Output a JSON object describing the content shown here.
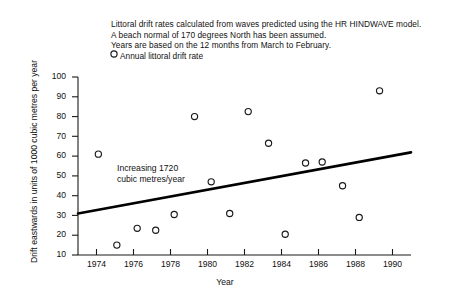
{
  "header": {
    "line1": "Littoral drift rates calculated from waves predicted using the HR HINDWAVE model.",
    "line2": "A beach normal of 170 degrees North has been assumed.",
    "line3": "Years are based on the 12 months from March to February."
  },
  "legend": {
    "marker_icon": "open-circle-icon",
    "label": "Annual littoral drift rate"
  },
  "annotation": {
    "line1": "Increasing 1720",
    "line2": "cubic metres/year"
  },
  "chart_data": {
    "type": "scatter",
    "title": "Littoral drift rates calculated from waves predicted using the HR HINDWAVE model. A beach normal of 170 degrees North has been assumed. Years are based on the 12 months from March to February.",
    "xlabel": "Year",
    "ylabel": "Drift eastwards in units of 1000 cubic metres per year",
    "xlim": [
      1973,
      1991
    ],
    "ylim": [
      10,
      100
    ],
    "xticks": [
      1974,
      1976,
      1978,
      1980,
      1982,
      1984,
      1986,
      1988,
      1990
    ],
    "xtick_labels": [
      "1974",
      "1976",
      "1978",
      "1980",
      "1982",
      "1984",
      "1986",
      "1988",
      "1990"
    ],
    "yticks": [
      10,
      20,
      30,
      40,
      50,
      60,
      70,
      80,
      90,
      100
    ],
    "ytick_labels": [
      "10",
      "20",
      "30",
      "40",
      "50",
      "60",
      "70",
      "80",
      "90",
      "100"
    ],
    "grid": false,
    "legend_position": "top-left",
    "marker": "open-circle",
    "series": [
      {
        "name": "Annual littoral drift rate",
        "x": [
          1974.1,
          1975.1,
          1976.2,
          1977.2,
          1978.2,
          1979.3,
          1980.2,
          1981.2,
          1982.2,
          1983.3,
          1984.2,
          1985.3,
          1986.2,
          1987.3,
          1988.2,
          1989.3
        ],
        "y": [
          61,
          15,
          23.5,
          22.5,
          30.5,
          80,
          47,
          31,
          82.5,
          66.5,
          20.5,
          56.5,
          57,
          45,
          29,
          93
        ]
      }
    ],
    "trendline": {
      "label": "Increasing 1720 cubic metres/year",
      "slope_per_year": 1.72,
      "x": [
        1973,
        1991
      ],
      "y": [
        31,
        61.9
      ]
    }
  },
  "axes": {
    "xlabel": "Year",
    "ylabel": "Drift eastwards in units of 1000 cubic metres per year"
  }
}
